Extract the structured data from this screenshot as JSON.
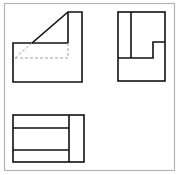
{
  "figure": {
    "type": "orthographic-projection",
    "views": [
      "front-view",
      "side-view",
      "top-view"
    ],
    "colors": {
      "background": "#ffffff",
      "frame": "#b0b0b0",
      "line": "#111111",
      "hidden_line": "#999999"
    }
  }
}
